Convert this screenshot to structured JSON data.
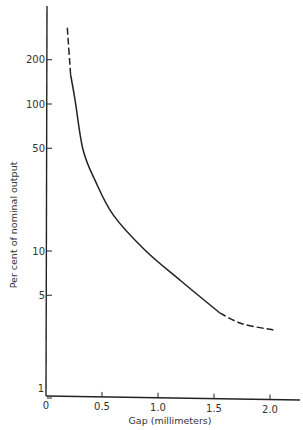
{
  "chart_data": {
    "type": "line",
    "title": "",
    "xlabel": "Gap (millimeters)",
    "ylabel": "Per cent of nominal output",
    "xscale": "linear",
    "yscale": "log",
    "xlim": [
      0,
      2.2
    ],
    "ylim": [
      1,
      400
    ],
    "grid": false,
    "legend": null,
    "x_ticks": [
      0,
      0.5,
      1.0,
      1.5,
      2.0
    ],
    "x_tick_labels": [
      "0",
      "0.5",
      "1.0",
      "1.5",
      "2.0"
    ],
    "y_ticks": [
      1,
      5,
      10,
      50,
      100,
      200
    ],
    "y_tick_labels": [
      "1",
      "5",
      "10",
      "50",
      "100",
      "200"
    ],
    "series": [
      {
        "name": "output vs gap",
        "style_segments": [
          {
            "style": "dashed",
            "x": [
              0.19,
              0.22
            ],
            "y": [
              330,
              158
            ]
          },
          {
            "style": "solid",
            "x": [
              0.22,
              0.26,
              0.33,
              0.44,
              0.6,
              0.88,
              1.2,
              1.55
            ],
            "y": [
              158,
              106,
              49,
              30,
              17.6,
              10.2,
              6.3,
              3.8
            ]
          },
          {
            "style": "dashed",
            "x": [
              1.55,
              1.75,
              2.03
            ],
            "y": [
              3.8,
              3.2,
              2.9
            ]
          }
        ],
        "x": [
          0.19,
          0.22,
          0.26,
          0.33,
          0.44,
          0.6,
          0.88,
          1.2,
          1.55,
          1.75,
          2.03
        ],
        "y": [
          330,
          158,
          106,
          49,
          30,
          17.6,
          10.2,
          6.3,
          3.8,
          3.2,
          2.9
        ]
      }
    ]
  }
}
